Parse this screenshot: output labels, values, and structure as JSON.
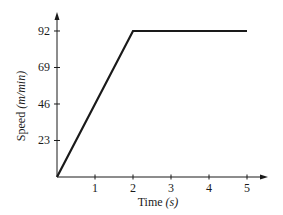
{
  "chart_data": {
    "type": "line",
    "title": "",
    "xlabel": "Time",
    "xlabel_unit": "(s)",
    "ylabel": "Speed",
    "ylabel_unit": "(m/min)",
    "x_ticks": [
      1,
      2,
      3,
      4,
      5
    ],
    "y_ticks": [
      23,
      46,
      69,
      92
    ],
    "xlim": [
      0,
      5.5
    ],
    "ylim": [
      0,
      100
    ],
    "grid": false,
    "legend": null,
    "series": [
      {
        "name": "speed",
        "x": [
          0,
          2,
          5
        ],
        "y": [
          0,
          92,
          92
        ]
      }
    ]
  },
  "layout": {
    "origin_px": [
      57,
      177
    ],
    "px_per_x": 38,
    "px_per_y": 1.587,
    "x_axis_end_px": 268,
    "y_axis_top_px": 12,
    "line_color": "#1a1a1a"
  }
}
